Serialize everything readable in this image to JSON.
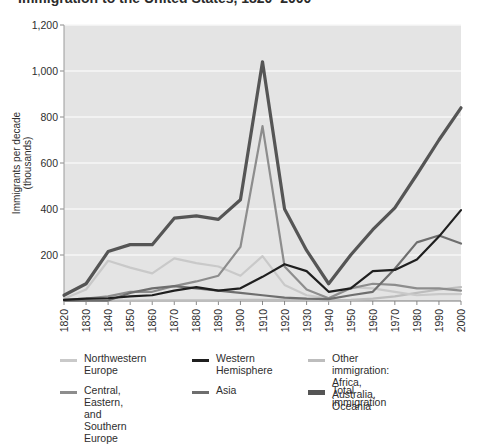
{
  "figure": {
    "title_partial": "Immigration to the United States, 1820–2000",
    "background": "#ffffff",
    "plot_background": "#e4e4e4",
    "gridline_color": "#f7f7f7"
  },
  "axes": {
    "y_axis_title": "Immigrants per decade\n(thousands)",
    "y_ticks": [
      "0",
      "200",
      "400",
      "600",
      "800",
      "1,000",
      "1,200"
    ],
    "y_tick_values": [
      0,
      200,
      400,
      600,
      800,
      1000,
      1200
    ],
    "x_ticks": [
      "1820",
      "1830",
      "1840",
      "1850",
      "1860",
      "1870",
      "1880",
      "1890",
      "1900",
      "1910",
      "1920",
      "1930",
      "1940",
      "1950",
      "1960",
      "1970",
      "1980",
      "1990",
      "2000"
    ]
  },
  "legend": {
    "columns": [
      [
        {
          "label": "Northwestern\nEurope",
          "color": "#c9c9c9",
          "thick": false,
          "name": "legend-northwestern-europe"
        },
        {
          "label": "Central, Eastern, and\nSouthern Europe",
          "color": "#8d8d8d",
          "thick": false,
          "name": "legend-central-eastern-southern-europe"
        }
      ],
      [
        {
          "label": "Western\nHemisphere",
          "color": "#1f1f1f",
          "thick": false,
          "name": "legend-western-hemisphere"
        },
        {
          "label": "Asia",
          "color": "#6e6e6e",
          "thick": false,
          "name": "legend-asia"
        }
      ],
      [
        {
          "label": "Other immigration:\nAfrica, Australia, Oceania",
          "color": "#bdbdbd",
          "thick": false,
          "name": "legend-other-immigration"
        },
        {
          "label": "Total immigration",
          "color": "#555555",
          "thick": true,
          "name": "legend-total-immigration"
        }
      ]
    ]
  },
  "chart_data": {
    "type": "line",
    "title": "Immigration to the United States, 1820–2000",
    "xlabel": "",
    "ylabel": "Immigrants per decade (thousands)",
    "xlim": [
      1820,
      2000
    ],
    "ylim": [
      0,
      1200
    ],
    "grid": true,
    "legend_position": "bottom",
    "x": [
      1820,
      1830,
      1840,
      1850,
      1860,
      1870,
      1880,
      1890,
      1900,
      1910,
      1920,
      1930,
      1940,
      1950,
      1960,
      1970,
      1980,
      1990,
      2000
    ],
    "series": [
      {
        "name": "Northwestern Europe",
        "color": "#c9c9c9",
        "values": [
          10,
          50,
          175,
          145,
          120,
          185,
          165,
          150,
          110,
          195,
          70,
          25,
          12,
          60,
          55,
          40,
          25,
          30,
          30
        ]
      },
      {
        "name": "Central, Eastern, and Southern Europe",
        "color": "#8d8d8d",
        "values": [
          5,
          10,
          20,
          40,
          40,
          65,
          85,
          110,
          235,
          760,
          150,
          50,
          12,
          55,
          75,
          70,
          55,
          55,
          45
        ]
      },
      {
        "name": "Western Hemisphere",
        "color": "#1f1f1f",
        "values": [
          5,
          10,
          12,
          20,
          25,
          45,
          60,
          45,
          55,
          105,
          160,
          130,
          40,
          55,
          130,
          135,
          180,
          280,
          395
        ]
      },
      {
        "name": "Asia",
        "color": "#6e6e6e",
        "values": [
          2,
          2,
          2,
          35,
          55,
          65,
          55,
          45,
          35,
          25,
          15,
          10,
          8,
          25,
          40,
          140,
          255,
          285,
          250
        ]
      },
      {
        "name": "Other immigration: Africa, Australia, Oceania",
        "color": "#bdbdbd",
        "values": [
          2,
          2,
          2,
          2,
          3,
          3,
          3,
          3,
          5,
          5,
          5,
          5,
          3,
          5,
          10,
          20,
          35,
          50,
          60
        ]
      },
      {
        "name": "Total immigration",
        "color": "#555555",
        "values": [
          25,
          75,
          215,
          245,
          245,
          360,
          370,
          355,
          440,
          1040,
          400,
          220,
          75,
          200,
          310,
          405,
          550,
          700,
          840
        ]
      }
    ],
    "annotations": [
      {
        "text": "Peak decade 1900–1910: total about 1,040 thousand",
        "x": 1910,
        "y": 1040
      }
    ]
  }
}
